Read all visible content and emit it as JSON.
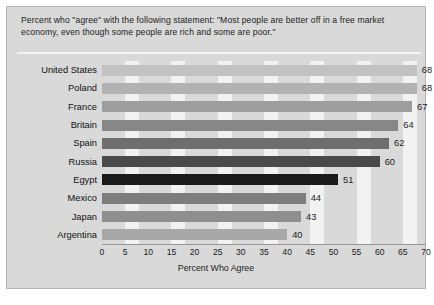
{
  "card": {
    "title": "Percent who \"agree\" with the following statement: \"Most people are better off in a free market economy, even though some people are rich and some are poor.\""
  },
  "chart_data": {
    "type": "bar",
    "orientation": "horizontal",
    "title": "Percent who \"agree\" with the following statement: \"Most people are better off in a free market economy, even though some people are rich and some are poor.\"",
    "xlabel": "Percent Who Agree",
    "ylabel": "",
    "categories": [
      "United States",
      "Poland",
      "France",
      "Britain",
      "Spain",
      "Russia",
      "Egypt",
      "Mexico",
      "Japan",
      "Argentina"
    ],
    "values": [
      68,
      68,
      67,
      64,
      62,
      60,
      51,
      44,
      43,
      40
    ],
    "bar_colors": [
      "#c2c2c2",
      "#b2b2b2",
      "#9e9e9e",
      "#878787",
      "#6e6e6e",
      "#4a4a4a",
      "#1a1a1a",
      "#7d7d7d",
      "#8f8f8f",
      "#a8a8a8"
    ],
    "xlim": [
      0,
      70
    ],
    "xticks": [
      0,
      5,
      10,
      15,
      20,
      25,
      30,
      35,
      40,
      45,
      50,
      55,
      60,
      65,
      70
    ],
    "grid": "vertical-bands",
    "legend": "none",
    "background": "#d9d9d9",
    "band_color": "#f2f2f2"
  }
}
